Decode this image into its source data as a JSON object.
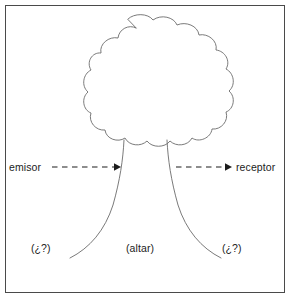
{
  "figure": {
    "background_color": "#ffffff",
    "frame_color": "#4a4a4a",
    "stroke_color": "#6b6b6b",
    "text_color": "#1c1c1c"
  },
  "labels": {
    "emisor": "emisor",
    "receptor": "receptor",
    "left_unknown": "(¿?)",
    "center": "(altar)",
    "right_unknown": "(¿?)"
  },
  "arrows": {
    "left": {
      "style": "dashed",
      "direction": "right",
      "from_label": "emisor"
    },
    "right": {
      "style": "dashed",
      "direction": "right",
      "to_label": "receptor"
    }
  },
  "shapes": {
    "canopy": "cloud-scalloped-tree-crown",
    "trunk": "flared-tree-trunk"
  }
}
